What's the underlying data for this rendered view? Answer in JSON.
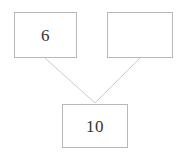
{
  "diagram": {
    "type": "number-bond",
    "canvas": {
      "width": 184,
      "height": 155,
      "background": "#ffffff"
    },
    "style": {
      "box_border_color": "#b8b8b8",
      "box_fill_color": "#ffffff",
      "connector_color": "#cccccc",
      "text_color": "#333333"
    },
    "nodes": [
      {
        "id": "addend-left",
        "role": "addend",
        "value": "6",
        "empty": false,
        "x": 14,
        "y": 12,
        "width": 63,
        "height": 46
      },
      {
        "id": "addend-right",
        "role": "addend",
        "value": "",
        "empty": true,
        "x": 107,
        "y": 12,
        "width": 66,
        "height": 46
      },
      {
        "id": "sum",
        "role": "total",
        "value": "10",
        "empty": false,
        "x": 62,
        "y": 104,
        "width": 66,
        "height": 44
      }
    ],
    "connectors": [
      {
        "id": "left-to-sum",
        "from": "addend-left",
        "to": "sum",
        "x1": 45,
        "y1": 58,
        "x2": 95,
        "y2": 103
      },
      {
        "id": "right-to-sum",
        "from": "addend-right",
        "to": "sum",
        "x1": 140,
        "y1": 58,
        "x2": 95,
        "y2": 103
      }
    ]
  }
}
